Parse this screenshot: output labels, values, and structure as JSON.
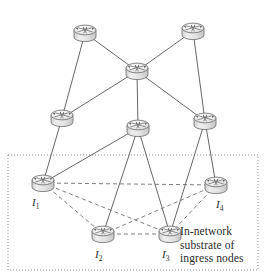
{
  "figure": {
    "kind": "network-topology-diagram",
    "colors": {
      "node_fill": "#e9e9e9",
      "node_fill_top": "#f2f2f2",
      "node_stroke": "#6b6b6b",
      "core_link": "#555555",
      "overlay_link": "#6e6e6e",
      "region_border": "#8a8a8a",
      "text": "#2b2b2b",
      "background": "#ffffff"
    },
    "region": {
      "label": "In-network substrate of ingress nodes",
      "label_lines": [
        "In-network",
        "substrate of",
        "ingress nodes"
      ],
      "border_style": "dotted",
      "x": 8,
      "y": 155,
      "width": 250,
      "height": 115
    },
    "nodes": [
      {
        "id": "n1",
        "icon": "router-icon",
        "label": "",
        "x": 85,
        "y": 30,
        "layer": "core",
        "in_region": false
      },
      {
        "id": "n2",
        "icon": "router-icon",
        "label": "",
        "x": 193,
        "y": 28,
        "layer": "core",
        "in_region": false
      },
      {
        "id": "n3",
        "icon": "router-icon",
        "label": "",
        "x": 137,
        "y": 68,
        "layer": "core",
        "in_region": false
      },
      {
        "id": "n4",
        "icon": "router-icon",
        "label": "",
        "x": 62,
        "y": 115,
        "layer": "core",
        "in_region": false
      },
      {
        "id": "n5",
        "icon": "router-icon",
        "label": "",
        "x": 138,
        "y": 125,
        "layer": "core",
        "in_region": false
      },
      {
        "id": "n6",
        "icon": "router-icon",
        "label": "",
        "x": 205,
        "y": 118,
        "layer": "core",
        "in_region": false
      },
      {
        "id": "i1",
        "icon": "router-icon",
        "label": "I",
        "sub": "1",
        "x": 43,
        "y": 180,
        "layer": "ingress",
        "in_region": true
      },
      {
        "id": "i2",
        "icon": "router-icon",
        "label": "I",
        "sub": "2",
        "x": 103,
        "y": 231,
        "layer": "ingress",
        "in_region": true
      },
      {
        "id": "i3",
        "icon": "router-icon",
        "label": "I",
        "sub": "3",
        "x": 170,
        "y": 231,
        "layer": "ingress",
        "in_region": true
      },
      {
        "id": "i4",
        "icon": "router-icon",
        "label": "I",
        "sub": "4",
        "x": 216,
        "y": 182,
        "layer": "ingress",
        "in_region": true
      }
    ],
    "node_labels": [
      {
        "for": "i1",
        "text": "I",
        "sub": "1",
        "x": 32,
        "y": 206
      },
      {
        "for": "i2",
        "text": "I",
        "sub": "2",
        "x": 95,
        "y": 258
      },
      {
        "for": "i3",
        "text": "I",
        "sub": "3",
        "x": 162,
        "y": 258
      },
      {
        "for": "i4",
        "text": "I",
        "sub": "4",
        "x": 216,
        "y": 208
      }
    ],
    "links_solid": [
      {
        "from": "n1",
        "to": "n3"
      },
      {
        "from": "n2",
        "to": "n3"
      },
      {
        "from": "n1",
        "to": "n4"
      },
      {
        "from": "n2",
        "to": "n6"
      },
      {
        "from": "n3",
        "to": "n4"
      },
      {
        "from": "n3",
        "to": "n5"
      },
      {
        "from": "n3",
        "to": "n6"
      },
      {
        "from": "n4",
        "to": "i1"
      },
      {
        "from": "n5",
        "to": "i2"
      },
      {
        "from": "n5",
        "to": "i3"
      },
      {
        "from": "n5",
        "to": "i1"
      },
      {
        "from": "n6",
        "to": "i3"
      },
      {
        "from": "n6",
        "to": "i4"
      }
    ],
    "links_dashed": [
      {
        "from": "i1",
        "to": "i2"
      },
      {
        "from": "i1",
        "to": "i3"
      },
      {
        "from": "i1",
        "to": "i4"
      },
      {
        "from": "i2",
        "to": "i3"
      },
      {
        "from": "i2",
        "to": "i4"
      },
      {
        "from": "i3",
        "to": "i4"
      }
    ]
  }
}
